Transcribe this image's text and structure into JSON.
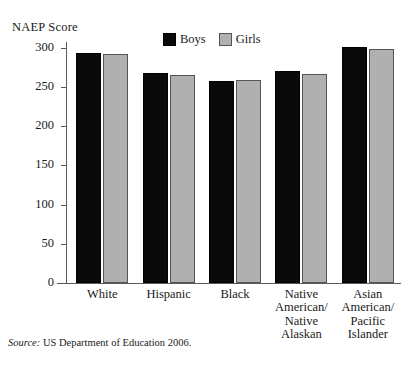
{
  "axis_title": "NAEP Score",
  "legend": {
    "entries": [
      {
        "label": "Boys",
        "color": "#0a0a0a",
        "key": "boys"
      },
      {
        "label": "Girls",
        "color": "#b0b0b0",
        "key": "girls"
      }
    ]
  },
  "source": {
    "prefix": "Source:",
    "text": "US Department of Education 2006."
  },
  "chart_data": {
    "type": "bar",
    "title": "",
    "subtitle": "",
    "xlabel": "",
    "ylabel": "NAEP Score",
    "ylim": [
      0,
      310
    ],
    "yticks": [
      0,
      50,
      100,
      150,
      200,
      250,
      300
    ],
    "ytick_labels": [
      "0",
      "50",
      "100",
      "150",
      "200",
      "250",
      "300"
    ],
    "grid": false,
    "legend_position": "top-center",
    "categories": [
      "White",
      "Hispanic",
      "Black",
      "Native\nAmerican/\nNative\nAlaskan",
      "Asian\nAmerican/\nPacific\nIslander"
    ],
    "series": [
      {
        "name": "Boys",
        "color": "#0a0a0a",
        "values": [
          293,
          268,
          258,
          271,
          301
        ]
      },
      {
        "name": "Girls",
        "color": "#b0b0b0",
        "values": [
          292,
          265,
          259,
          267,
          299
        ]
      }
    ]
  }
}
